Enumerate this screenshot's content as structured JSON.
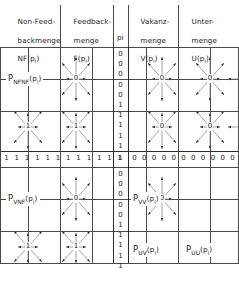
{
  "figure": {
    "width": 239,
    "height": 285,
    "line_color": "#4a4a4a",
    "text_color": "#1a1a1a",
    "background": "#ffffff"
  },
  "columns": [
    {
      "id": "nf",
      "lines": [
        "Non-Feed-",
        "backmenge",
        "NF(p"
      ],
      "var": "NF",
      "arg": "p",
      "sub": "i"
    },
    {
      "id": "f",
      "lines": [
        "Feedback-",
        "menge",
        "F(p"
      ],
      "var": "F",
      "arg": "p",
      "sub": "i"
    },
    {
      "id": "v",
      "lines": [
        "Vakanz-",
        "menge",
        "V(p"
      ],
      "var": "V",
      "arg": "p",
      "sub": "i"
    },
    {
      "id": "u",
      "lines": [
        "Unter-",
        "menge",
        "U(p"
      ],
      "var": "U",
      "arg": "p",
      "sub": "i"
    }
  ],
  "column_headers": {
    "nf": {
      "l1": "Non-Feed-",
      "l2": "backmenge",
      "l3a": "NF(p",
      "l3b": "i",
      "l3c": ")"
    },
    "f": {
      "l1": "Feedback-",
      "l2": "menge",
      "l3a": "F(p",
      "l3b": "i",
      "l3c": ")"
    },
    "v": {
      "l1": "Vakanz-",
      "l2": "menge",
      "l3a": "V(p",
      "l3b": "i",
      "l3c": ")"
    },
    "u": {
      "l1": "Unter-",
      "l2": "menge",
      "l3a": "U(p",
      "l3b": "i",
      "l3c": ")"
    }
  },
  "axis_marker": {
    "text": "p",
    "sub": "i"
  },
  "quadrants": [
    {
      "id": "nfnf",
      "base": "P",
      "sub": "NFNF",
      "arg_open": "(p",
      "arg_sub": "i",
      "arg_close": ")"
    },
    {
      "id": "vnf",
      "base": "P",
      "sub": "VNF",
      "arg_open": "(p",
      "arg_sub": "i",
      "arg_close": ")"
    },
    {
      "id": "vv",
      "base": "P",
      "sub": "VV",
      "arg_open": "(p",
      "arg_sub": "i",
      "arg_close": ")"
    },
    {
      "id": "uv",
      "base": "P",
      "sub": "UV",
      "arg_open": "(p",
      "arg_sub": "i",
      "arg_close": ")"
    },
    {
      "id": "uu",
      "base": "P",
      "sub": "UU",
      "arg_open": "(p",
      "arg_sub": "i",
      "arg_close": ")"
    }
  ],
  "digit_row": {
    "left": [
      "1",
      "1",
      "1",
      "1",
      "1",
      "1",
      "1",
      "1",
      "1",
      "1",
      "1"
    ],
    "center": [
      "1"
    ],
    "right": [
      "0",
      "0",
      "0",
      "0",
      "0",
      "0",
      "0",
      "0",
      "0",
      "0",
      "0"
    ]
  },
  "digit_col": {
    "top": [
      "0",
      "0",
      "0",
      "0",
      "0",
      "1",
      "1",
      "1",
      "1",
      "1"
    ],
    "center": [
      "1"
    ],
    "bottom": [
      "0",
      "0",
      "0",
      "0",
      "0",
      "1",
      "1",
      "1",
      "1",
      "1"
    ]
  },
  "nodes": [
    {
      "id": "n-nfnf-a",
      "label": "0"
    },
    {
      "id": "n-nfnf-b",
      "label": "1"
    },
    {
      "id": "n-f-a",
      "label": "0"
    },
    {
      "id": "n-f-b",
      "label": "1"
    },
    {
      "id": "n-v-a",
      "label": "0"
    },
    {
      "id": "n-v-b",
      "label": "0"
    },
    {
      "id": "n-u-a",
      "label": "0"
    },
    {
      "id": "n-u-b",
      "label": "0"
    },
    {
      "id": "n-vnf-a",
      "label": "0"
    },
    {
      "id": "n-vnf-b",
      "label": "1"
    },
    {
      "id": "n-uv-a",
      "label": "1"
    },
    {
      "id": "n-vv-a",
      "label": "0"
    }
  ]
}
